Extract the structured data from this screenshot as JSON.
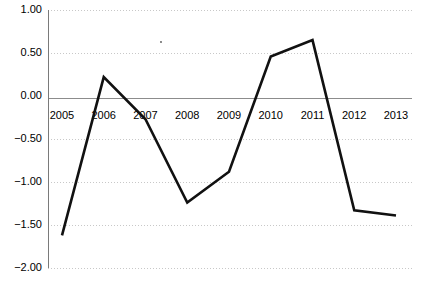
{
  "chart_data": {
    "type": "line",
    "title": "",
    "subtitle": "",
    "xlabel": "",
    "ylabel": "",
    "categories": [
      "2005",
      "2006",
      "2007",
      "2008",
      "2009",
      "2010",
      "2011",
      "2012",
      "2013"
    ],
    "values": [
      -1.62,
      0.22,
      -0.27,
      -1.24,
      -0.88,
      0.46,
      0.65,
      -1.33,
      -1.39
    ],
    "series": [
      {
        "name": "series-1",
        "values": [
          -1.62,
          0.22,
          -0.27,
          -1.24,
          -0.88,
          0.46,
          0.65,
          -1.33,
          -1.39
        ],
        "color": "#111111"
      }
    ],
    "ylim": [
      -2.0,
      1.0
    ],
    "ytick_labels": [
      "1.00",
      "0.50",
      "0.00",
      "-0.50",
      "-1.00",
      "-1.50",
      "-2.00"
    ],
    "ytick_values": [
      1.0,
      0.5,
      0.0,
      -0.5,
      -1.0,
      -1.5,
      -2.0
    ],
    "xtick_labels": [
      "2005",
      "2006",
      "2007",
      "2008",
      "2009",
      "2010",
      "2011",
      "2012",
      "2013"
    ],
    "grid": true,
    "grid_style": "dotted-horizontal",
    "grid_color": "#c8c8c8",
    "zero_line_color": "#8c8c8c",
    "axis_color": "#7a7a7a",
    "legend": null,
    "legend_position": "none",
    "annotations": [],
    "background_color": "#ffffff"
  },
  "axes": {
    "y": {
      "ticks": [
        {
          "label": "1.00",
          "value": 1.0
        },
        {
          "label": "0.50",
          "value": 0.5
        },
        {
          "label": "0.00",
          "value": 0.0
        },
        {
          "label": "-0.50",
          "value": -0.5
        },
        {
          "label": "-1.00",
          "value": -1.0
        },
        {
          "label": "-1.50",
          "value": -1.5
        },
        {
          "label": "-2.00",
          "value": -2.0
        }
      ]
    },
    "x": {
      "ticks": [
        {
          "label": "2005"
        },
        {
          "label": "2006"
        },
        {
          "label": "2007"
        },
        {
          "label": "2008"
        },
        {
          "label": "2009"
        },
        {
          "label": "2010"
        },
        {
          "label": "2011"
        },
        {
          "label": "2012"
        },
        {
          "label": "2013"
        }
      ]
    }
  }
}
